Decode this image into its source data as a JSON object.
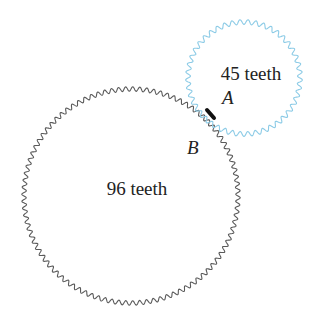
{
  "diagram": {
    "gears": [
      {
        "id": "large",
        "label": "96 teeth",
        "teeth": 96,
        "color": "#5a5a5a",
        "center": [
          131,
          196
        ],
        "radius": 107
      },
      {
        "id": "small",
        "label": "45 teeth",
        "teeth": 45,
        "color": "#8ccbe6",
        "center": [
          244,
          78
        ],
        "radius": 56
      }
    ],
    "points": {
      "A": "A",
      "B": "B"
    },
    "contact_mark_color": "#111111"
  }
}
